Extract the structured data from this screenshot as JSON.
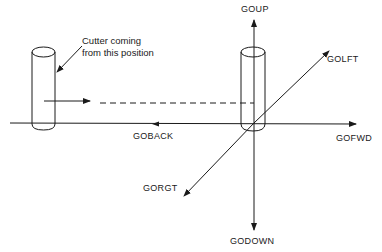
{
  "diagram": {
    "callout": {
      "line1": "Cutter coming",
      "line2": "from this position"
    },
    "axes": {
      "up": "GOUP",
      "down": "GODOWN",
      "left_diag": "GOLFT",
      "right_diag": "GORGT",
      "forward": "GOFWD",
      "back": "GOBACK"
    },
    "colors": {
      "line": "#1a1a1a",
      "background": "#ffffff"
    }
  }
}
